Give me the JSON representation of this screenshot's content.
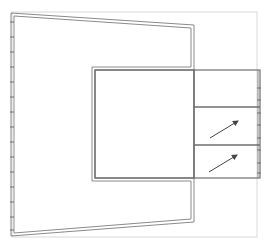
{
  "diagram": {
    "type": "technical line drawing",
    "width": 272,
    "height": 247,
    "colors": {
      "background": "#ffffff",
      "outer_frame": "#d8d8d8",
      "line_dark": "#6e6e6e",
      "line_mid": "#8a8a8a",
      "arrow": "#444444"
    },
    "outer_frame": {
      "x": 12,
      "y": 12,
      "w": 245,
      "h": 225
    },
    "trapezoid": {
      "outer": [
        [
          11,
          13
        ],
        [
          194,
          25
        ],
        [
          194,
          70
        ],
        [
          95,
          70
        ],
        [
          95,
          178
        ],
        [
          194,
          178
        ],
        [
          194,
          222
        ],
        [
          11,
          236
        ]
      ],
      "inner_offset": 3
    },
    "center_square": {
      "x": 95,
      "y": 70,
      "w": 99,
      "h": 108
    },
    "side_column": {
      "x": 194,
      "y": 70,
      "w": 66,
      "h": 108,
      "dividers_y": [
        107,
        145
      ],
      "cells": [
        {
          "name": "top-cell",
          "y": 70,
          "h": 37,
          "arrow": false
        },
        {
          "name": "middle-cell",
          "y": 107,
          "h": 38,
          "arrow": true,
          "from": [
            210,
            138
          ],
          "to": [
            238,
            121
          ]
        },
        {
          "name": "bottom-cell",
          "y": 145,
          "h": 33,
          "arrow": true,
          "from": [
            209,
            172
          ],
          "to": [
            237,
            155
          ]
        }
      ]
    },
    "left_edge_ticks_y": [
      22,
      37,
      52,
      67,
      82,
      97,
      112,
      127,
      142,
      157,
      172,
      187,
      202,
      217,
      230
    ],
    "right_edge_ticks_y": [
      88,
      100,
      113,
      125,
      138,
      150,
      163,
      173
    ]
  }
}
